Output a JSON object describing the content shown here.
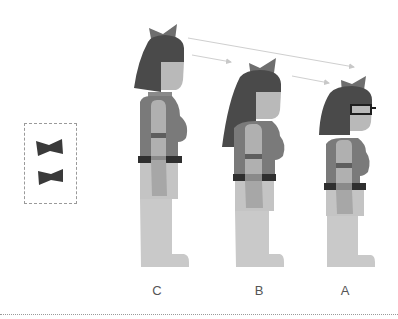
{
  "figure": {
    "title": "",
    "colors": {
      "hair": "#4a4a4a",
      "bow": "#6e6e6e",
      "skin": "#b9b9b9",
      "shirt": "#7a7a7a",
      "belt": "#2f2f2f",
      "pants": "#c4c4c4",
      "arrow": "#c8c8c8",
      "glasses": "#1e1e1e"
    },
    "legend": {
      "items": [
        {
          "icon": "bow-tie-icon"
        },
        {
          "icon": "bow-tie-icon"
        }
      ]
    },
    "characters": [
      {
        "label": "C",
        "size": "large",
        "glasses": false
      },
      {
        "label": "B",
        "size": "medium",
        "glasses": false
      },
      {
        "label": "A",
        "size": "small",
        "glasses": true
      }
    ],
    "arrows": [
      {
        "from": "C",
        "to": "A"
      },
      {
        "from": "C",
        "to": "B"
      },
      {
        "from": "B",
        "to": "A"
      }
    ]
  }
}
